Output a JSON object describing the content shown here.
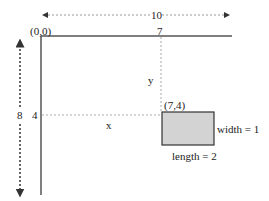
{
  "diagram": {
    "origin_label": "(0,0)",
    "total_width_label": "10",
    "total_height_label": "8",
    "x_tick_label": "7",
    "y_tick_label": "4",
    "x_dim_label": "x",
    "y_dim_label": "y",
    "point_label": "(7,4)",
    "rect_width_label": "width = 1",
    "rect_length_label": "length = 2",
    "colors": {
      "axis": "#555555",
      "dotted": "#999999",
      "arrow": "#333333",
      "rect_fill": "#d3d3d3",
      "rect_stroke": "#333333"
    }
  }
}
